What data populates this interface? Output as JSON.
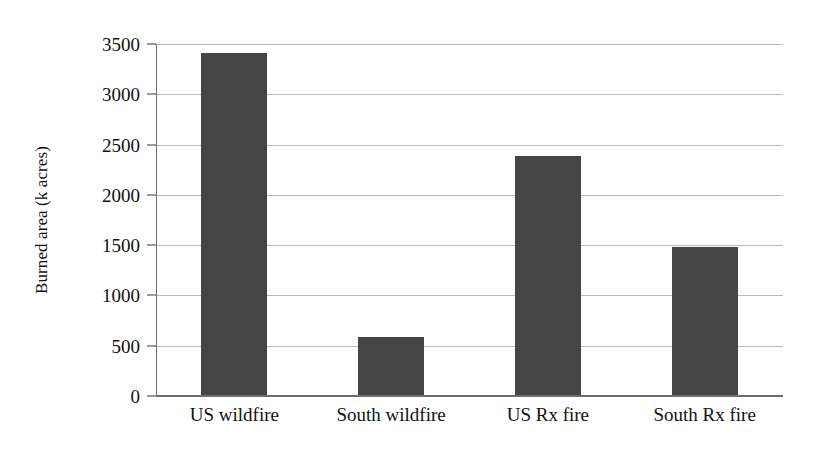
{
  "chart_data": {
    "type": "bar",
    "title": "",
    "subtitle": "",
    "xlabel": "",
    "ylabel": "Burned area (k acres)",
    "categories": [
      "US wildfire",
      "South wildfire",
      "US Rx fire",
      "South Rx fire"
    ],
    "values": [
      3400,
      580,
      2380,
      1470
    ],
    "ylim": [
      0,
      3500
    ],
    "yticks": [
      0,
      500,
      1000,
      1500,
      2000,
      2500,
      3000,
      3500
    ],
    "ytick_labels": [
      "0",
      "500",
      "1000",
      "1500",
      "2000",
      "2500",
      "3000",
      "3500"
    ],
    "grid": true,
    "grid_axis": "y",
    "legend": false,
    "legend_position": "none",
    "bar_color": "#454545",
    "gridline_color": "#b9b9b9",
    "axis_color": "#6e6e6e",
    "background_color": "#ffffff",
    "annotations": []
  }
}
